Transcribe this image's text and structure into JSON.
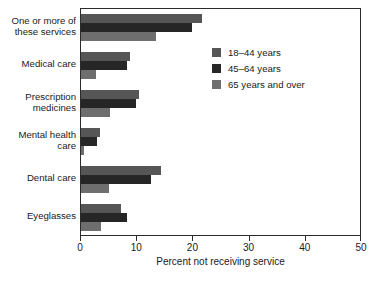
{
  "chart_data": {
    "type": "bar",
    "orientation": "horizontal",
    "title": "",
    "xlabel": "Percent not receiving service",
    "ylabel": "",
    "xlim": [
      0,
      50
    ],
    "xticks": [
      0,
      10,
      20,
      30,
      40,
      50
    ],
    "grid": false,
    "legend_position": "upper right inside",
    "categories": [
      "One or more of\nthese services",
      "Medical care",
      "Prescription\nmedicines",
      "Mental health\ncare",
      "Dental care",
      "Eyeglasses"
    ],
    "series": [
      {
        "name": "18–44 years",
        "color": "#565656",
        "values": [
          21.5,
          8.8,
          10.4,
          3.4,
          14.2,
          7.1
        ]
      },
      {
        "name": "45–64 years",
        "color": "#262626",
        "values": [
          19.8,
          8.1,
          9.7,
          2.9,
          12.4,
          8.2
        ]
      },
      {
        "name": "65 years and over",
        "color": "#6e6e6e",
        "values": [
          13.3,
          2.7,
          5.1,
          0.5,
          5.0,
          3.6
        ]
      }
    ]
  },
  "axis": {
    "tick_labels": [
      "0",
      "10",
      "20",
      "30",
      "40",
      "50"
    ],
    "x_title": "Percent not receiving service"
  },
  "legend": {
    "items": [
      {
        "label": "18–44 years",
        "color": "#565656"
      },
      {
        "label": "45–64 years",
        "color": "#262626"
      },
      {
        "label": "65 years and over",
        "color": "#6e6e6e"
      }
    ]
  }
}
